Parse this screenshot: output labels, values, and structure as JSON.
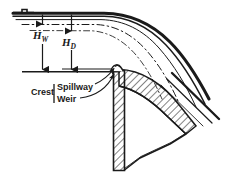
{
  "diagram": {
    "type": "engineering-cross-section",
    "labels": {
      "head_weir": "H",
      "head_weir_sub": "W",
      "head_design": "H",
      "head_design_sub": "D",
      "crest": "Crest",
      "spillway": "Spillway",
      "weir": "Weir"
    },
    "colors": {
      "line": "#1a1a1a",
      "fill": "#ffffff",
      "background": "#ffffff"
    },
    "elements": {
      "water_surface_label": "reservoir-water-surface",
      "nappe_label": "nappe-flow-profile",
      "crest_level_label": "crest-reference-level",
      "dam_body_label": "dam-body",
      "hatching_label": "hatched-concrete-section"
    }
  }
}
